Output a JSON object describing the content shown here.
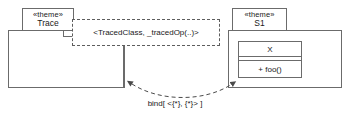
{
  "diagram": {
    "type": "uml-template-binding",
    "title": "",
    "stroke_color": "#6b6b6b",
    "text_color": "#1a1a1a",
    "background": "#ffffff"
  },
  "left_package": {
    "stereotype": "«theme»",
    "name": "Trace"
  },
  "template_parameters": {
    "text": "<TracedClass, _tracedOp(..)>"
  },
  "right_package": {
    "stereotype": "«theme»",
    "name": "S1",
    "inner_class": {
      "name": "X",
      "attributes": "",
      "operations": "+ foo()"
    }
  },
  "binding": {
    "label": "bind[ <{*}, {*}> ]"
  }
}
